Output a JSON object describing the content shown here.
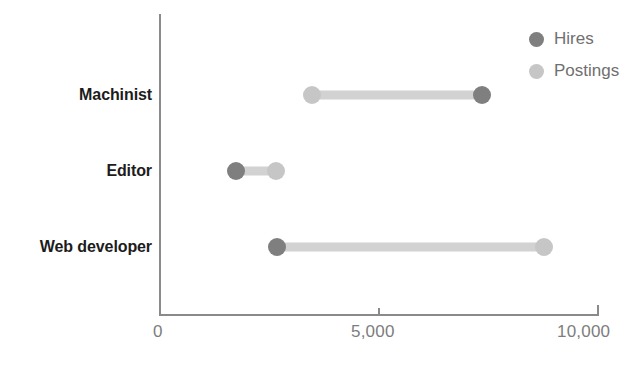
{
  "chart_data": {
    "type": "scatter",
    "subtype": "dumbbell",
    "title": "",
    "xlabel": "",
    "ylabel": "",
    "xlim": [
      0,
      10000
    ],
    "xticks": [
      0,
      5000,
      10000
    ],
    "xtick_labels": [
      "0",
      "5,000",
      "10,000"
    ],
    "grid": false,
    "legend_position": "top-right",
    "categories": [
      "Machinist",
      "Editor",
      "Web developer"
    ],
    "series": [
      {
        "name": "Hires",
        "color": "#7f7f7f",
        "values": [
          7350,
          1735,
          2670
        ]
      },
      {
        "name": "Postings",
        "color": "#c6c6c6",
        "values": [
          3470,
          2650,
          8770
        ]
      }
    ],
    "points": [
      {
        "category": "Machinist",
        "hires": 7350,
        "postings": 3470
      },
      {
        "category": "Editor",
        "hires": 1735,
        "postings": 2650
      },
      {
        "category": "Web developer",
        "hires": 2670,
        "postings": 8770
      }
    ]
  },
  "legend": {
    "items": [
      {
        "label": "Hires",
        "color": "#7f7f7f",
        "icon": "circle-marker-icon"
      },
      {
        "label": "Postings",
        "color": "#c6c6c6",
        "icon": "circle-marker-icon"
      }
    ]
  },
  "axis": {
    "x": {
      "ticks": [
        {
          "label": "0",
          "value": 0
        },
        {
          "label": "5,000",
          "value": 5000
        },
        {
          "label": "10,000",
          "value": 10000
        }
      ]
    },
    "y": {
      "ticks": [
        {
          "label": "Machinist",
          "value": 0
        },
        {
          "label": "Editor",
          "value": 1
        },
        {
          "label": "Web developer",
          "value": 2
        }
      ]
    }
  },
  "colors": {
    "hires": "#7f7f7f",
    "postings": "#c6c6c6",
    "connector": "#d2d2d2",
    "axis": "#8a8a8a",
    "tick_text": "#7d7d7d",
    "category_text": "#1c1c1c",
    "background": "#ffffff"
  }
}
